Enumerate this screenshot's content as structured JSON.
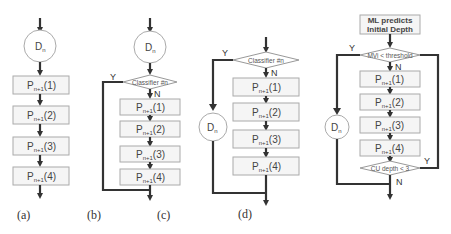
{
  "panels": {
    "a": {
      "caption": "(a)",
      "circle": "Dn",
      "boxes": [
        "Pn+1(1)",
        "Pn+1(2)",
        "Pn+1(3)",
        "Pn+1(4)"
      ]
    },
    "b": {
      "caption": "(b)"
    },
    "c": {
      "caption": "(c)",
      "circle": "Dn",
      "decision": "Classifier #n",
      "yes": "Y",
      "no": "N",
      "boxes": [
        "Pn+1(1)",
        "Pn+1(2)",
        "Pn+1(3)",
        "Pn+1(4)"
      ]
    },
    "d": {
      "caption": "(d)",
      "decision": "Classifier #n",
      "yes": "Y",
      "no": "N",
      "circle": "Dn",
      "boxes": [
        "Pn+1(1)",
        "Pn+1(2)",
        "Pn+1(3)",
        "Pn+1(4)"
      ]
    },
    "e": {
      "start_box": [
        "ML predicts",
        "Initial Depth"
      ],
      "decision1": "MVi < threshold",
      "decision2": "CU depth < 3",
      "yes": "Y",
      "no": "N",
      "circle": "Dn",
      "boxes": [
        "Pn+1(1)",
        "Pn+1(2)",
        "Pn+1(3)",
        "Pn+1(4)"
      ]
    }
  },
  "labels": {
    "P": "P",
    "sub": "n+1",
    "D": "D",
    "dsub": "n",
    "i1": "(1)",
    "i2": "(2)",
    "i3": "(3)",
    "i4": "(4)"
  }
}
